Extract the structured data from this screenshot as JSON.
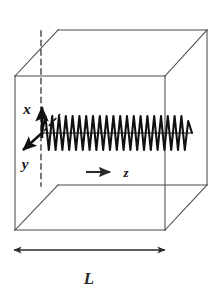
{
  "figure": {
    "background_color": "#ffffff",
    "line_color": "#444444",
    "wave_color": "#111111",
    "axis_color": "#111111"
  },
  "cube": {
    "name": "cavity-cube",
    "side_label": "L",
    "front_face": {
      "left_x": 15,
      "right_x": 165,
      "top_y": 76,
      "bottom_y": 230
    },
    "back_face": {
      "left_x": 58,
      "right_x": 207,
      "top_y": 30,
      "bottom_y": 185
    },
    "hidden_edge": {
      "style": "dashed",
      "x": 41,
      "top_y": 31,
      "bottom_y": 186
    }
  },
  "axes": {
    "origin": {
      "x": 42,
      "y": 133
    },
    "x_axis": {
      "label": "x",
      "direction": "up",
      "tip_x": 42,
      "tip_y": 103,
      "label_x": 27,
      "label_y": 113
    },
    "y_axis": {
      "label": "y",
      "direction": "down-left",
      "tip_x": 21,
      "tip_y": 152,
      "label_x": 23,
      "label_y": 168
    },
    "y_negative_hint": {
      "style": "dashed",
      "direction": "up-right",
      "tip_x": 60,
      "tip_y": 114
    },
    "z_axis": {
      "label": "z",
      "direction": "right",
      "arrow_start_x": 86,
      "arrow_end_x": 112,
      "arrow_y": 172,
      "label_x": 125,
      "label_y": 177
    }
  },
  "wave": {
    "name": "propagating-wave",
    "start_x": 42,
    "end_x": 192,
    "center_y": 133,
    "amplitude": 17,
    "cycles": 11,
    "stroke_width": 2.1
  },
  "dimension": {
    "name": "length-dimension",
    "label": "L",
    "arrow_left_x": 13,
    "arrow_right_x": 166,
    "arrow_y": 250,
    "label_x": 89,
    "label_y": 283
  }
}
